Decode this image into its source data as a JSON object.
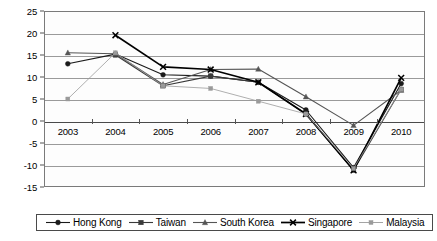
{
  "chart_data": {
    "type": "line",
    "title": "",
    "subtitle": "",
    "xlabel": "",
    "ylabel": "",
    "categories": [
      "2003",
      "2004",
      "2005",
      "2006",
      "2007",
      "2008",
      "2009",
      "2010"
    ],
    "x_tick_labels": [
      "2003",
      "2004",
      "2005",
      "2006",
      "2007",
      "2008",
      "2009",
      "2010"
    ],
    "y_tick_labels": [
      "25",
      "20",
      "15",
      "10",
      "5",
      "0",
      "-5",
      "-10",
      "-15"
    ],
    "y_tick_values": [
      25,
      20,
      15,
      10,
      5,
      0,
      -5,
      -10,
      -15
    ],
    "ylim": [
      -15,
      25
    ],
    "grid": true,
    "grid_axis": "y",
    "legend_position": "bottom",
    "series": [
      {
        "name": "Hong Kong",
        "marker": "filled-diamond",
        "color": "#1a1a1a",
        "values": [
          13.0,
          15.2,
          10.5,
          10.2,
          8.8,
          2.5,
          -10.6,
          8.5
        ]
      },
      {
        "name": "Taiwan",
        "marker": "filled-square",
        "color": "#3a3a3a",
        "values": [
          null,
          15.0,
          8.0,
          10.2,
          8.8,
          1.6,
          -11.2,
          7.2
        ]
      },
      {
        "name": "South Korea",
        "marker": "filled-triangle",
        "color": "#555555",
        "values": [
          15.5,
          15.3,
          8.3,
          11.7,
          11.8,
          5.5,
          -1.0,
          7.0
        ]
      },
      {
        "name": "Singapore",
        "marker": "cross-x",
        "color": "#000000",
        "values": [
          null,
          19.5,
          12.3,
          11.7,
          8.8,
          1.6,
          -11.2,
          9.8
        ]
      },
      {
        "name": "Malaysia",
        "marker": "light-square",
        "color": "#9a9a9a",
        "values": [
          5.0,
          15.5,
          8.0,
          7.4,
          4.5,
          1.6,
          -10.8,
          7.2
        ]
      }
    ],
    "legend_entries": [
      "Hong Kong",
      "Taiwan",
      "South Korea",
      "Singapore",
      "Malaysia"
    ]
  }
}
